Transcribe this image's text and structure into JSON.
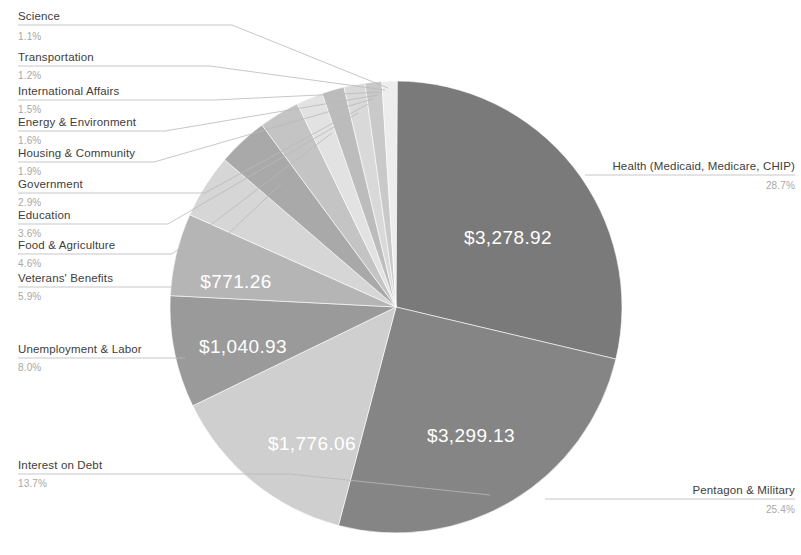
{
  "chart_data": {
    "type": "pie",
    "title": "",
    "subtitle": "",
    "xlabel": "",
    "ylabel": "",
    "legend_position": "callout-labels",
    "grid": false,
    "units": "dollars (billions)",
    "start_angle_deg": 0,
    "direction": "clockwise",
    "categories": [
      "Health (Medicaid, Medicare, CHIP)",
      "Pentagon & Military",
      "Interest on Debt",
      "Unemployment & Labor",
      "Veterans' Benefits",
      "Food & Agriculture",
      "Education",
      "Government",
      "Housing & Community",
      "Energy & Environment",
      "International Affairs",
      "Transportation",
      "Science"
    ],
    "percentages": [
      28.7,
      25.4,
      13.7,
      8.0,
      5.9,
      4.6,
      3.6,
      2.9,
      1.9,
      1.6,
      1.5,
      1.2,
      1.1
    ],
    "values": [
      3278.92,
      3299.13,
      1776.06,
      1040.93,
      771.26,
      null,
      null,
      null,
      null,
      null,
      null,
      null,
      null
    ],
    "value_labels": [
      "$3,278.92",
      "$3,299.13",
      "$1,776.06",
      "$1,040.93",
      "$771.26",
      "",
      "",
      "",
      "",
      "",
      "",
      "",
      ""
    ],
    "percent_labels": [
      "28.7%",
      "25.4%",
      "13.7%",
      "8.0%",
      "5.9%",
      "4.6%",
      "3.6%",
      "2.9%",
      "1.9%",
      "1.6%",
      "1.5%",
      "1.2%",
      "1.1%"
    ],
    "colors": [
      "#7a7a7a",
      "#858585",
      "#cfcfcf",
      "#9a9a9a",
      "#b5b5b5",
      "#d6d6d6",
      "#a9a9a9",
      "#c4c4c4",
      "#e2e2e2",
      "#bcbcbc",
      "#d9d9d9",
      "#c9c9c9",
      "#ededed"
    ]
  },
  "slices": [
    {
      "name": "Health (Medicaid, Medicare, CHIP)",
      "pct": "28.7%",
      "value": "$3,278.92",
      "color": "#7a7a7a"
    },
    {
      "name": "Pentagon & Military",
      "pct": "25.4%",
      "value": "$3,299.13",
      "color": "#858585"
    },
    {
      "name": "Interest on Debt",
      "pct": "13.7%",
      "value": "$1,776.06",
      "color": "#cfcfcf"
    },
    {
      "name": "Unemployment & Labor",
      "pct": "8.0%",
      "value": "$1,040.93",
      "color": "#9a9a9a"
    },
    {
      "name": "Veterans' Benefits",
      "pct": "5.9%",
      "value": "$771.26",
      "color": "#b5b5b5"
    },
    {
      "name": "Food & Agriculture",
      "pct": "4.6%",
      "value": "",
      "color": "#d6d6d6"
    },
    {
      "name": "Education",
      "pct": "3.6%",
      "value": "",
      "color": "#a9a9a9"
    },
    {
      "name": "Government",
      "pct": "2.9%",
      "value": "",
      "color": "#c4c4c4"
    },
    {
      "name": "Housing & Community",
      "pct": "1.9%",
      "value": "",
      "color": "#e2e2e2"
    },
    {
      "name": "Energy & Environment",
      "pct": "1.6%",
      "value": "",
      "color": "#bcbcbc"
    },
    {
      "name": "International Affairs",
      "pct": "1.5%",
      "value": "",
      "color": "#d9d9d9"
    },
    {
      "name": "Transportation",
      "pct": "1.2%",
      "value": "",
      "color": "#c9c9c9"
    },
    {
      "name": "Science",
      "pct": "1.1%",
      "value": "",
      "color": "#ededed"
    }
  ],
  "left_labels": [
    {
      "name": "Science",
      "pct": "1.1%"
    },
    {
      "name": "Transportation",
      "pct": "1.2%"
    },
    {
      "name": "International Affairs",
      "pct": "1.5%"
    },
    {
      "name": "Energy & Environment",
      "pct": "1.6%"
    },
    {
      "name": "Housing & Community",
      "pct": "1.9%"
    },
    {
      "name": "Government",
      "pct": "2.9%"
    },
    {
      "name": "Education",
      "pct": "3.6%"
    },
    {
      "name": "Food & Agriculture",
      "pct": "4.6%"
    },
    {
      "name": "Veterans' Benefits",
      "pct": "5.9%"
    },
    {
      "name": "Unemployment & Labor",
      "pct": "8.0%"
    },
    {
      "name": "Interest on Debt",
      "pct": "13.7%"
    }
  ],
  "right_labels": [
    {
      "name": "Health (Medicaid, Medicare, CHIP)",
      "pct": "28.7%"
    },
    {
      "name": "Pentagon & Military",
      "pct": "25.4%"
    }
  ],
  "inner_values": [
    {
      "label": "$3,278.92"
    },
    {
      "label": "$3,299.13"
    },
    {
      "label": "$1,776.06"
    },
    {
      "label": "$1,040.93"
    },
    {
      "label": "$771.26"
    }
  ]
}
